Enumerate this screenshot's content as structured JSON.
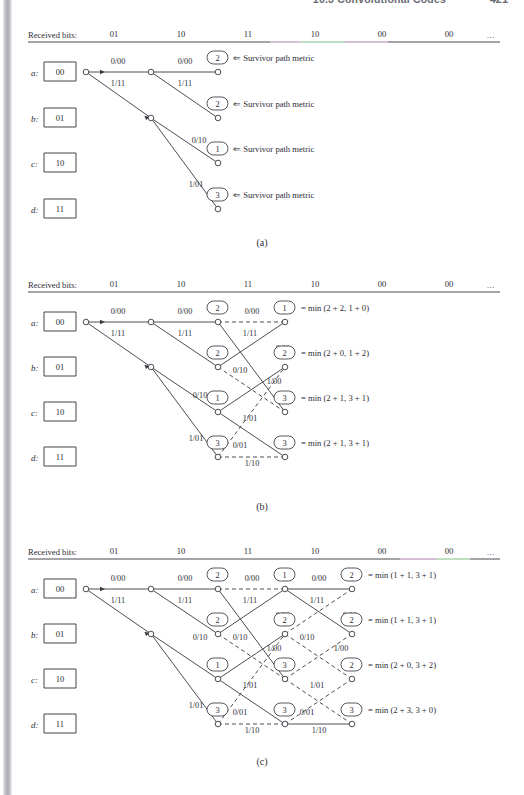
{
  "header": {
    "title": "10.3 Convolutional Codes",
    "page_number": "421"
  },
  "figure": {
    "received_label": "Received bits:",
    "received_bits": [
      "01",
      "10",
      "11",
      "10",
      "00",
      "00"
    ],
    "ellipsis": "...",
    "states": [
      {
        "name": "a",
        "label": "a:",
        "value": "00"
      },
      {
        "name": "b",
        "label": "b:",
        "value": "01"
      },
      {
        "name": "c",
        "label": "c:",
        "value": "10"
      },
      {
        "name": "d",
        "label": "d:",
        "value": "11"
      }
    ],
    "branch_labels": {
      "a_zero": "0/00",
      "a_one": "1/11",
      "b_zero": "0/10",
      "b_one": "1/01",
      "c_zero": "0/11",
      "c_one": "1/00",
      "d_zero": "0/01",
      "d_one": "1/10"
    },
    "survivor_text": "⇐ Survivor path metric",
    "panels": [
      {
        "id": "a",
        "caption": "(a)",
        "stages": 2,
        "metrics": [
          {
            "state": "a",
            "value": "2"
          },
          {
            "state": "b",
            "value": "2"
          },
          {
            "state": "c",
            "value": "1"
          },
          {
            "state": "d",
            "value": "3"
          }
        ],
        "edge_labels": [
          {
            "text": "0/00",
            "x": 113,
            "y": 63
          },
          {
            "text": "1/11",
            "x": 113,
            "y": 83
          },
          {
            "text": "0/00",
            "x": 180,
            "y": 63
          },
          {
            "text": "1/11",
            "x": 180,
            "y": 83
          },
          {
            "text": "0/10",
            "x": 180,
            "y": 144
          },
          {
            "text": "1/01",
            "x": 180,
            "y": 188
          }
        ],
        "survivor_rows": [
          "a",
          "b",
          "c",
          "d"
        ]
      },
      {
        "id": "b",
        "caption": "(b)",
        "stages": 3,
        "metrics": [
          {
            "state": "a",
            "value": "2",
            "stage": 2
          },
          {
            "state": "b",
            "value": "2",
            "stage": 2
          },
          {
            "state": "c",
            "value": "1",
            "stage": 2
          },
          {
            "state": "d",
            "value": "3",
            "stage": 2
          },
          {
            "state": "a",
            "value": "1",
            "stage": 3
          },
          {
            "state": "b",
            "value": "2",
            "stage": 3
          },
          {
            "state": "c",
            "value": "3",
            "stage": 3
          },
          {
            "state": "d",
            "value": "3",
            "stage": 3
          }
        ],
        "equations": [
          "= min (2 + 2, 1 + 0)",
          "= min (2 + 0, 1 + 2)",
          "= min (2 + 1, 3 + 1)",
          "= min (2 + 1, 3 + 1)"
        ]
      },
      {
        "id": "c",
        "caption": "(c)",
        "stages": 4,
        "metrics": [
          {
            "state": "a",
            "value": "2",
            "stage": 2
          },
          {
            "state": "b",
            "value": "2",
            "stage": 2
          },
          {
            "state": "c",
            "value": "1",
            "stage": 2
          },
          {
            "state": "d",
            "value": "3",
            "stage": 2
          },
          {
            "state": "a",
            "value": "1",
            "stage": 3
          },
          {
            "state": "b",
            "value": "2",
            "stage": 3
          },
          {
            "state": "c",
            "value": "3",
            "stage": 3
          },
          {
            "state": "d",
            "value": "3",
            "stage": 3
          },
          {
            "state": "a",
            "value": "2",
            "stage": 4
          },
          {
            "state": "b",
            "value": "2",
            "stage": 4
          },
          {
            "state": "c",
            "value": "2",
            "stage": 4
          },
          {
            "state": "d",
            "value": "3",
            "stage": 4
          }
        ],
        "equations": [
          "= min (1 + 1, 3 + 1)",
          "= min (1 + 1, 3 + 1)",
          "= min (2 + 0, 3 + 2)",
          "= min (2 + 3, 3 + 0)"
        ]
      }
    ]
  },
  "colors": {
    "ink": "#2d2d35",
    "rule": "#4a4a52",
    "tint_green": "#7fbf7f",
    "tint_magenta": "#b07fb0"
  }
}
